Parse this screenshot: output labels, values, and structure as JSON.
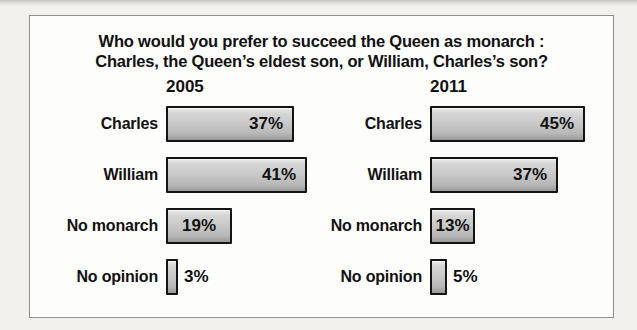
{
  "title": {
    "line1": "Who would you prefer to succeed the Queen as monarch :",
    "line2": "Charles, the Queen’s eldest son, or William, Charles’s son?"
  },
  "chart_data": {
    "type": "bar",
    "orientation": "horizontal",
    "title": "Who would you prefer to succeed the Queen as monarch : Charles, the Queen’s eldest son, or William, Charles’s son?",
    "categories": [
      "Charles",
      "William",
      "No monarch",
      "No opinion"
    ],
    "series": [
      {
        "name": "2005",
        "values": [
          37,
          41,
          19,
          3
        ]
      },
      {
        "name": "2011",
        "values": [
          45,
          37,
          13,
          5
        ]
      }
    ],
    "value_suffix": "%",
    "xlim": [
      0,
      50
    ],
    "grid": false,
    "legend_position": "none",
    "colors": {
      "page_background": "#f2f1ee",
      "frame_background": "#fdfdfc",
      "frame_border": "#8f8f8f",
      "bar_border": "#141414",
      "bar_fill_light": "#ebebeb",
      "bar_fill_mid": "#c7c7c7",
      "bar_fill_dark": "#999999",
      "text": "#111111"
    }
  }
}
